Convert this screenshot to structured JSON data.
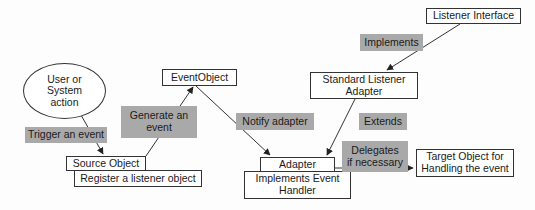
{
  "diagram": {
    "nodes": {
      "user_action": "User or\nSystem\naction",
      "source_object": "Source Object",
      "register_listener": "Register a listener object",
      "event_object": "EventObject",
      "listener_interface": "Listener Interface",
      "standard_listener_adapter": "Standard Listener\nAdapter",
      "adapter": "Adapter",
      "implements_event_handler": "Implements Event\nHandler",
      "target_object": "Target Object for\nHandling the event"
    },
    "edge_labels": {
      "trigger": "Trigger an event",
      "generate": "Generate an\nevent",
      "notify": "Notify adapter",
      "implements": "Implements",
      "extends": "Extends",
      "delegates": "Delegates\nif necessary"
    },
    "edges": [
      {
        "from": "User or System action",
        "to": "Source Object",
        "label": "Trigger an event"
      },
      {
        "from": "Source Object",
        "to": "EventObject",
        "label": "Generate an event"
      },
      {
        "from": "EventObject",
        "to": "Adapter",
        "label": "Notify adapter"
      },
      {
        "from": "Listener Interface",
        "to": "Standard Listener Adapter",
        "label": "Implements"
      },
      {
        "from": "Standard Listener Adapter",
        "to": "Adapter",
        "label": "Extends"
      },
      {
        "from": "Adapter",
        "to": "Target Object for Handling the event",
        "label": "Delegates if necessary"
      }
    ],
    "colors": {
      "label_fill": "#a9a9a9",
      "line": "#333333",
      "box_fill": "#ffffff"
    }
  }
}
